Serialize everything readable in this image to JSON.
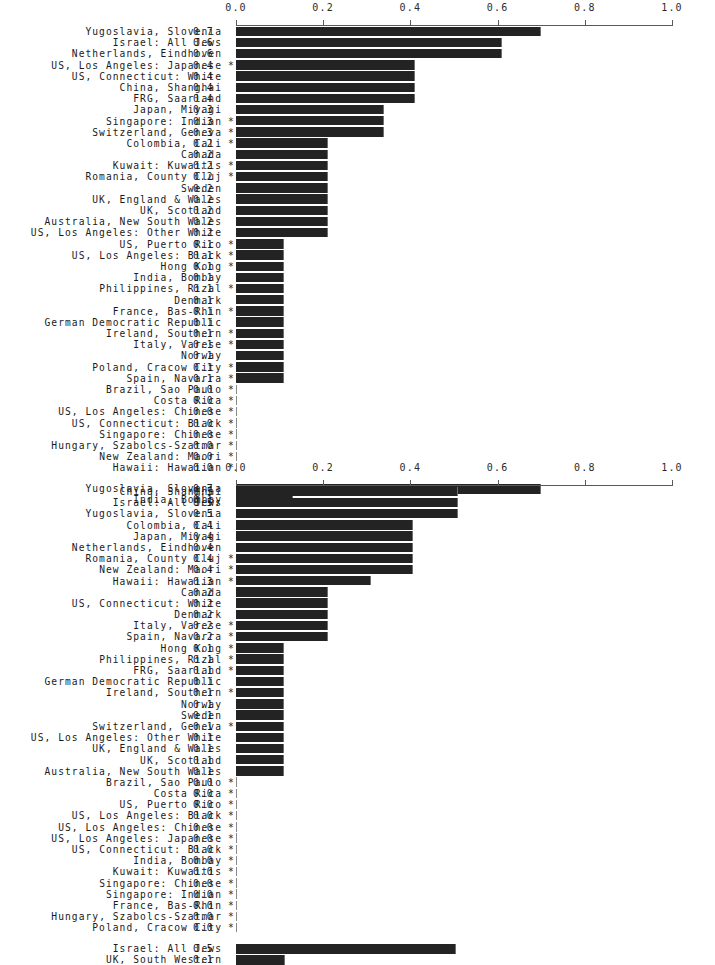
{
  "figure": {
    "axis_min": 0.0,
    "axis_max": 1.0,
    "tick_labels": [
      "0.0",
      "0.2",
      "0.4",
      "0.6",
      "0.8",
      "1.0"
    ],
    "tick_values": [
      0.0,
      0.2,
      0.4,
      0.6,
      0.8,
      1.0
    ],
    "star_glyph": "*",
    "bar_color": "#232323",
    "axis_color": "#5a5a5a"
  },
  "chart_data": [
    {
      "type": "bar",
      "title": "",
      "xlabel": "",
      "ylabel": "",
      "orientation": "horizontal",
      "xlim": [
        0.0,
        1.0
      ],
      "grid": false,
      "legend": "none",
      "xticks": [
        0.0,
        0.2,
        0.4,
        0.6,
        0.8,
        1.0
      ],
      "xticklabels": [
        "0.0",
        "0.2",
        "0.4",
        "0.6",
        "0.8",
        "1.0"
      ],
      "categories": [
        "Yugoslavia, Slovenia",
        "Israel: All Jews",
        "Netherlands, Eindhoven",
        "US, Los Angeles: Japanese",
        "US, Connecticut: White",
        "China, Shanghai",
        "FRG, Saarland",
        "Japan, Miyagi",
        "Singapore: Indian",
        "Switzerland, Geneva",
        "Colombia, Cali",
        "Canada",
        "Kuwait: Kuwaitis",
        "Romania, County Cluj",
        "Sweden",
        "UK, England & Wales",
        "UK, Scotland",
        "Australia, New South Wales",
        "US, Los Angeles: Other White",
        "US, Puerto Rico",
        "US, Los Angeles: Black",
        "Hong Kong",
        "India, Bombay",
        "Philippines, Rizal",
        "Denmark",
        "France, Bas-Rhin",
        "German Democratic Republic",
        "Ireland, Southern",
        "Italy, Varese",
        "Norway",
        "Poland, Cracow City",
        "Spain, Navarra",
        "Brazil, Sao Paulo",
        "Costa Rica",
        "US, Los Angeles: Chinese",
        "US, Connecticut: Black",
        "Singapore: Chinese",
        "Hungary, Szabolcs-Szatmar",
        "New Zealand: Maori",
        "Hawaii: Hawaiian"
      ],
      "values": [
        0.7,
        0.61,
        0.61,
        0.41,
        0.41,
        0.41,
        0.41,
        0.34,
        0.34,
        0.34,
        0.21,
        0.21,
        0.21,
        0.21,
        0.21,
        0.21,
        0.21,
        0.21,
        0.21,
        0.11,
        0.11,
        0.11,
        0.11,
        0.11,
        0.11,
        0.11,
        0.11,
        0.11,
        0.11,
        0.11,
        0.11,
        0.11,
        0.0,
        0.0,
        0.0,
        0.0,
        0.0,
        0.0,
        0.0,
        0.0
      ],
      "value_labels": [
        "0.7",
        "0.6",
        "0.6",
        "0.4",
        "0.4",
        "0.4",
        "0.4",
        "0.3",
        "0.3",
        "0.3",
        "0.2",
        "0.2",
        "0.2",
        "0.2",
        "0.2",
        "0.2",
        "0.2",
        "0.2",
        "0.2",
        "0.1",
        "0.1",
        "0.1",
        "0.1",
        "0.1",
        "0.1",
        "0.1",
        "0.1",
        "0.1",
        "0.1",
        "0.1",
        "0.1",
        "0.1",
        "0.0",
        "0.0",
        "0.0",
        "0.0",
        "0.0",
        "0.0",
        "0.0",
        "0.0"
      ],
      "starred": [
        false,
        false,
        false,
        true,
        false,
        false,
        false,
        false,
        true,
        true,
        true,
        false,
        true,
        true,
        false,
        false,
        false,
        false,
        false,
        true,
        true,
        true,
        false,
        true,
        false,
        true,
        false,
        true,
        true,
        false,
        true,
        true,
        true,
        true,
        true,
        true,
        true,
        true,
        true,
        true
      ],
      "separate_group": {
        "categories": [
          "Yugoslavia, Slovenia",
          "India, Bombay"
        ],
        "values": [
          0.7,
          0.13
        ],
        "value_labels": [
          "0.7",
          "0.1"
        ],
        "starred": [
          false,
          false
        ]
      }
    },
    {
      "type": "bar",
      "title": "",
      "xlabel": "",
      "ylabel": "",
      "orientation": "horizontal",
      "xlim": [
        0.0,
        1.0
      ],
      "grid": false,
      "legend": "none",
      "xticks": [
        0.0,
        0.2,
        0.4,
        0.6,
        0.8,
        1.0
      ],
      "xticklabels": [
        "0.0",
        "0.2",
        "0.4",
        "0.6",
        "0.8",
        "1.0"
      ],
      "categories": [
        "China, Shanghai",
        "Israel: All Jews",
        "Yugoslavia, Slovenia",
        "Colombia, Cali",
        "Japan, Miyagi",
        "Netherlands, Eindhoven",
        "Romania, County Cluj",
        "New Zealand: Maori",
        "Hawaii: Hawaiian",
        "Canada",
        "US, Connecticut: White",
        "Denmark",
        "Italy, Varese",
        "Spain, Navarra",
        "Hong Kong",
        "Philippines, Rizal",
        "FRG, Saarland",
        "German Democratic Republic",
        "Ireland, Southern",
        "Norway",
        "Sweden",
        "Switzerland, Geneva",
        "US, Los Angeles: Other White",
        "UK, England & Wales",
        "UK, Scotland",
        "Australia, New South Wales",
        "Brazil, Sao Paulo",
        "Costa Rica",
        "US, Puerto Rico",
        "US, Los Angeles: Black",
        "US, Los Angeles: Chinese",
        "US, Los Angeles: Japanese",
        "US, Connecticut: Black",
        "India, Bombay",
        "Kuwait: Kuwaitis",
        "Singapore: Chinese",
        "Singapore: Indian",
        "France, Bas-Rhin",
        "Hungary, Szabolcs-Szatmar",
        "Poland, Cracow City"
      ],
      "values": [
        0.51,
        0.51,
        0.51,
        0.405,
        0.405,
        0.405,
        0.405,
        0.405,
        0.31,
        0.21,
        0.21,
        0.21,
        0.21,
        0.21,
        0.11,
        0.11,
        0.11,
        0.11,
        0.11,
        0.11,
        0.11,
        0.11,
        0.11,
        0.11,
        0.11,
        0.11,
        0.0,
        0.0,
        0.0,
        0.0,
        0.0,
        0.0,
        0.0,
        0.0,
        0.0,
        0.0,
        0.0,
        0.0,
        0.0,
        0.0
      ],
      "value_labels": [
        "0.5",
        "0.5",
        "0.5",
        "0.4",
        "0.4",
        "0.4",
        "0.4",
        "0.4",
        "0.3",
        "0.2",
        "0.2",
        "0.2",
        "0.2",
        "0.2",
        "0.1",
        "0.1",
        "0.1",
        "0.1",
        "0.1",
        "0.1",
        "0.1",
        "0.1",
        "0.1",
        "0.1",
        "0.1",
        "0.1",
        "0.0",
        "0.0",
        "0.0",
        "0.0",
        "0.0",
        "0.0",
        "0.0",
        "0.0",
        "0.0",
        "0.0",
        "0.0",
        "0.0",
        "0.0",
        "0.0"
      ],
      "starred": [
        false,
        false,
        false,
        false,
        false,
        false,
        true,
        true,
        true,
        false,
        false,
        false,
        true,
        true,
        true,
        true,
        true,
        false,
        true,
        false,
        false,
        true,
        false,
        false,
        false,
        false,
        true,
        true,
        true,
        true,
        true,
        true,
        true,
        true,
        true,
        true,
        true,
        true,
        true,
        true
      ],
      "separate_group": {
        "categories": [
          "Israel: All Jews",
          "UK, South Western"
        ],
        "values": [
          0.505,
          0.112
        ],
        "value_labels": [
          "0.5",
          "0.1"
        ],
        "starred": [
          false,
          false
        ]
      }
    }
  ]
}
